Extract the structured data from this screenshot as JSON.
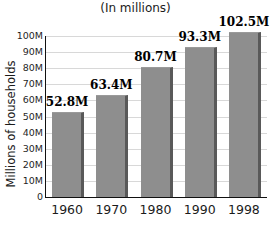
{
  "chart_data": {
    "type": "bar",
    "title": "(In millions)",
    "xlabel": "",
    "ylabel": "Millions of households",
    "categories": [
      "1960",
      "1970",
      "1980",
      "1990",
      "1998"
    ],
    "values": [
      52.8,
      63.4,
      80.7,
      93.3,
      102.5
    ],
    "value_labels": [
      "52.8M",
      "63.4M",
      "80.7M",
      "93.3M",
      "102.5M"
    ],
    "ylim": [
      0,
      110
    ],
    "ytick_values": [
      0,
      10,
      20,
      30,
      40,
      50,
      60,
      70,
      80,
      90,
      100
    ],
    "ytick_labels": [
      "0",
      "10M",
      "20M",
      "30M",
      "40M",
      "50M",
      "60M",
      "70M",
      "80M",
      "90M",
      "100M"
    ],
    "grid": true,
    "legend": "none",
    "bar_color": "#8e8e8e",
    "bar_shadow_color": "#595959",
    "gridline_color": "#d8d8d8",
    "axis_color": "#111111",
    "text_color": "#1b1b1b"
  }
}
